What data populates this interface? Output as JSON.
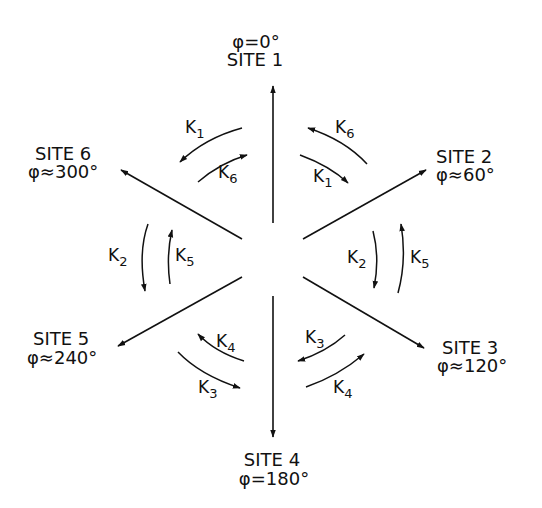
{
  "diagram": {
    "type": "hexagonal site-exchange diagram",
    "sites": [
      {
        "id": 1,
        "label": "SITE 1",
        "angle": "φ=0°"
      },
      {
        "id": 2,
        "label": "SITE 2",
        "angle": "φ≈60°"
      },
      {
        "id": 3,
        "label": "SITE 3",
        "angle": "φ≈120°"
      },
      {
        "id": 4,
        "label": "SITE 4",
        "angle": "φ=180°"
      },
      {
        "id": 5,
        "label": "SITE 5",
        "angle": "φ≈240°"
      },
      {
        "id": 6,
        "label": "SITE 6",
        "angle": "φ≈300°"
      }
    ],
    "rates": {
      "k_letter": "K",
      "top_left_outer": "1",
      "top_left_inner": "6",
      "top_right_outer": "6",
      "top_right_inner": "1",
      "left_outer": "2",
      "left_inner": "5",
      "right_inner": "2",
      "right_outer": "5",
      "bottom_left_inner": "4",
      "bottom_left_outer": "3",
      "bottom_right_inner": "3",
      "bottom_right_outer": "4"
    }
  }
}
